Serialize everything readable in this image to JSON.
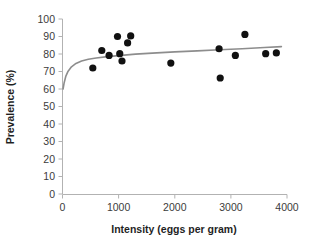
{
  "chart_data": {
    "type": "scatter",
    "title": "",
    "xlabel": "Intensity (eggs per gram)",
    "ylabel": "Prevalence (%)",
    "xlim": [
      0,
      4000
    ],
    "ylim": [
      0,
      100
    ],
    "xticks": [
      0,
      1000,
      2000,
      3000,
      4000
    ],
    "yticks": [
      0,
      10,
      20,
      30,
      40,
      50,
      60,
      70,
      80,
      90,
      100
    ],
    "xtick_labels": [
      "0",
      "1000",
      "2000",
      "3000",
      "4000"
    ],
    "ytick_labels": [
      "0",
      "10",
      "20",
      "30",
      "40",
      "50",
      "60",
      "70",
      "80",
      "90",
      "100"
    ],
    "grid": false,
    "legend": false,
    "marker": "filled-circle",
    "marker_color": "#111111",
    "curve_color": "#8d8d8d",
    "points": [
      {
        "x": 540,
        "y": 72.0
      },
      {
        "x": 700,
        "y": 82.0
      },
      {
        "x": 830,
        "y": 79.2
      },
      {
        "x": 980,
        "y": 90.0
      },
      {
        "x": 1020,
        "y": 80.2
      },
      {
        "x": 1060,
        "y": 76.0
      },
      {
        "x": 1160,
        "y": 86.3
      },
      {
        "x": 1215,
        "y": 90.3
      },
      {
        "x": 1930,
        "y": 74.8
      },
      {
        "x": 2790,
        "y": 83.0
      },
      {
        "x": 2810,
        "y": 66.3
      },
      {
        "x": 3080,
        "y": 79.2
      },
      {
        "x": 3250,
        "y": 91.2
      },
      {
        "x": 3620,
        "y": 80.2
      },
      {
        "x": 3810,
        "y": 80.6
      }
    ],
    "fit_curve": {
      "description": "saturating logarithmic trend line",
      "x": [
        10,
        30,
        60,
        100,
        160,
        240,
        340,
        460,
        600,
        800,
        1000,
        1300,
        1600,
        2000,
        2400,
        2800,
        3200,
        3600,
        3900
      ],
      "y": [
        60.0,
        63.6,
        67.4,
        70.2,
        72.7,
        74.6,
        76.0,
        77.0,
        77.7,
        78.5,
        79.1,
        79.9,
        80.5,
        81.2,
        81.8,
        82.4,
        83.0,
        83.7,
        84.2
      ]
    }
  }
}
